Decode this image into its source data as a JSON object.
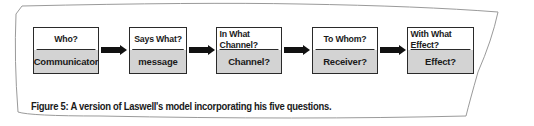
{
  "diagram": {
    "type": "flowchart",
    "boxes": [
      {
        "question": "Who?",
        "answer": "Communicator"
      },
      {
        "question": "Says What?",
        "answer": "message"
      },
      {
        "question": "In What Channel?",
        "answer": "Channel?"
      },
      {
        "question": "To Whom?",
        "answer": "Receiver?"
      },
      {
        "question": "With What Effect?",
        "answer": "Effect?"
      }
    ],
    "caption": "Figure 5: A version of Laswell's model incorporating his five questions.",
    "colors": {
      "border": "#2a2a2a",
      "answer_fill": "#d3d3d3",
      "question_fill": "#ffffff",
      "arrow": "#111111"
    }
  }
}
